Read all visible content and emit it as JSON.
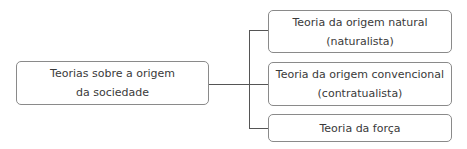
{
  "diagram": {
    "root": {
      "line1": "Teorias sobre a origem",
      "line2": "da sociedade"
    },
    "children": [
      {
        "line1": "Teoria da origem natural",
        "line2": "(naturalista)"
      },
      {
        "line1": "Teoria da origem convencional",
        "line2": "(contratualista)"
      },
      {
        "line1": "Teoria da força"
      }
    ],
    "colors": {
      "border": "#8a8a8a",
      "connector": "#555555",
      "text": "#3a3a3a"
    }
  }
}
